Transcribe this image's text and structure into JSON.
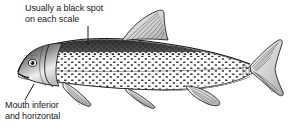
{
  "figure": {
    "background_color": "#ffffff",
    "ink_color": "#1a1a1a",
    "width": 293,
    "height": 126
  },
  "annotations": [
    {
      "id": "spot",
      "line1": "Usually a black spot",
      "line2": "on each scale",
      "leader": "vertical line from text down to the fish's back"
    },
    {
      "id": "mouth",
      "line1": "Mouth inferior",
      "line2": "and horizontal",
      "leader": "diagonal line from text up to the fish's mouth"
    }
  ],
  "subject": {
    "name": "fish-side-view",
    "orientation": "facing left",
    "style": "pen-and-ink stipple engraving, grayscale",
    "parts": [
      "snout",
      "inferior-mouth",
      "eye",
      "gill-cover",
      "dark-dorsal-back",
      "scaled-body-with-spots",
      "dorsal-fin",
      "pectoral-fin",
      "pelvic-fin",
      "anal-fin",
      "caudal-fin"
    ]
  }
}
